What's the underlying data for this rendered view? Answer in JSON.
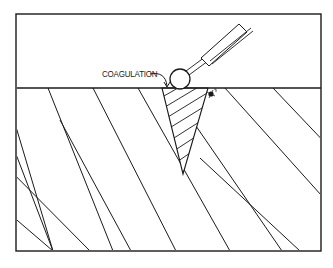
{
  "figure": {
    "label": "COAGULATION",
    "colors": {
      "ink": "#1a1a1a",
      "background": "#ffffff"
    },
    "frame": {
      "x1": 16,
      "y1": 14,
      "x2": 321,
      "y2": 251
    },
    "surface_y": 88,
    "probe": {
      "ball": {
        "cx": 180,
        "cy": 79,
        "r": 10
      },
      "shaft_end": [
        208,
        57
      ],
      "handle_start": [
        204,
        63
      ],
      "handle_end": [
        246,
        25
      ]
    },
    "coagulation_zone": {
      "top_left": [
        162,
        88
      ],
      "top_right": [
        208,
        88
      ],
      "apex": [
        183,
        174
      ]
    },
    "debris_mark": {
      "x": 211,
      "y": 94
    }
  }
}
